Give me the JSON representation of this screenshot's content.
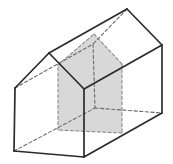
{
  "figure": {
    "canvas": {
      "width": 173,
      "height": 164,
      "background": "#ffffff"
    },
    "colors": {
      "solid_edge": "#2b2b2b",
      "hidden_edge": "#6b6b6b",
      "section_fill": "#d8d8d8",
      "section_edge": "#8a8a8a"
    },
    "stroke": {
      "solid_width": 1.7,
      "hidden_width": 1.1,
      "hidden_dash": "3.2 2.4",
      "section_width": 1.1,
      "section_dash": "3 2.4"
    },
    "vertices": {
      "A": {
        "x": 49,
        "y": 53
      },
      "L": {
        "x": 15,
        "y": 88
      },
      "LB": {
        "x": 14,
        "y": 151
      },
      "RB": {
        "x": 84,
        "y": 157
      },
      "R": {
        "x": 84,
        "y": 89
      },
      "A2": {
        "x": 127,
        "y": 9
      },
      "L2": {
        "x": 93,
        "y": 44
      },
      "LB2": {
        "x": 95,
        "y": 108
      },
      "RB2": {
        "x": 162,
        "y": 113
      },
      "R2": {
        "x": 162,
        "y": 45
      }
    },
    "solid_edges": [
      {
        "name": "front-roof-left",
        "from": "A",
        "to": "L"
      },
      {
        "name": "front-roof-right",
        "from": "A",
        "to": "R"
      },
      {
        "name": "front-wall-left",
        "from": "L",
        "to": "LB"
      },
      {
        "name": "front-bottom",
        "from": "LB",
        "to": "RB"
      },
      {
        "name": "front-wall-right",
        "from": "R",
        "to": "RB"
      },
      {
        "name": "ridge",
        "from": "A",
        "to": "A2"
      },
      {
        "name": "eave-right",
        "from": "R",
        "to": "R2"
      },
      {
        "name": "bottom-right",
        "from": "RB",
        "to": "RB2"
      },
      {
        "name": "back-roof-right",
        "from": "A2",
        "to": "R2"
      },
      {
        "name": "back-wall-right",
        "from": "R2",
        "to": "RB2"
      }
    ],
    "hidden_edges": [
      {
        "name": "eave-left",
        "from": "L",
        "to": "L2"
      },
      {
        "name": "back-roof-left",
        "from": "A2",
        "to": "L2"
      },
      {
        "name": "back-wall-left",
        "from": "L2",
        "to": "LB2"
      },
      {
        "name": "back-bottom",
        "from": "LB2",
        "to": "RB2"
      },
      {
        "name": "bottom-left",
        "from": "LB",
        "to": "LB2"
      }
    ],
    "section": {
      "name": "shaded-cross-section",
      "points": [
        {
          "x": 94,
          "y": 34
        },
        {
          "x": 122,
          "y": 64
        },
        {
          "x": 122,
          "y": 133
        },
        {
          "x": 58,
          "y": 130
        },
        {
          "x": 58,
          "y": 65
        }
      ]
    }
  }
}
